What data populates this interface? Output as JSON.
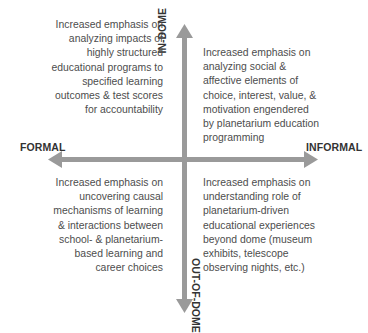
{
  "diagram": {
    "type": "quadrant",
    "axes": {
      "horizontal": {
        "left_label": "FORMAL",
        "right_label": "INFORMAL"
      },
      "vertical": {
        "top_label": "IN-DOME",
        "bottom_label": "OUT-OF-DOME"
      }
    },
    "arrow_color": "#9a9a9a",
    "quadrants": {
      "top_left": {
        "lines": [
          "Increased emphasis on",
          "analyzing impacts of",
          "highly structured",
          "educational programs to",
          "specified learning",
          "outcomes & test scores",
          "for accountability"
        ]
      },
      "top_right": {
        "lines": [
          "Increased emphasis on",
          "analyzing social &",
          "affective elements of",
          "choice, interest, value, &",
          "motivation engendered",
          "by planetarium education",
          "programming"
        ]
      },
      "bottom_left": {
        "lines": [
          "Increased emphasis on",
          "uncovering causal",
          "mechanisms of learning",
          "& interactions between",
          "school- & planetarium-",
          "based learning and",
          "career choices"
        ]
      },
      "bottom_right": {
        "lines": [
          "Increased emphasis on",
          "understanding role of",
          "planetarium-driven",
          "educational experiences",
          "beyond dome (museum",
          "exhibits, telescope",
          "observing nights, etc.)"
        ]
      }
    }
  }
}
